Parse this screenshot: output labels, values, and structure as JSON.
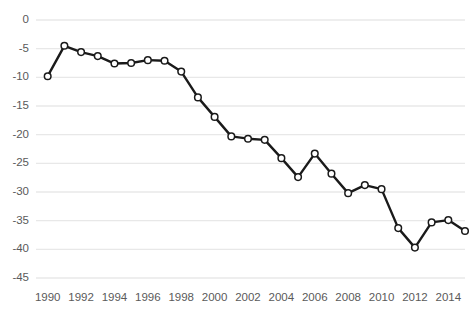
{
  "chart_data": {
    "type": "line",
    "title": "",
    "subtitle": "",
    "xlabel": "",
    "ylabel": "",
    "grid": true,
    "grid_axis": "y",
    "legend": false,
    "legend_position": "none",
    "xlim": [
      1989.3,
      2015.0
    ],
    "ylim": [
      -45,
      0
    ],
    "yticks": [
      0,
      -5,
      -10,
      -15,
      -20,
      -25,
      -30,
      -35,
      -40,
      -45
    ],
    "ytick_labels": [
      "0",
      "-5",
      "-10",
      "-15",
      "-20",
      "-25",
      "-30",
      "-35",
      "-40",
      "-45"
    ],
    "xticks": [
      1990,
      1992,
      1994,
      1996,
      1998,
      2000,
      2002,
      2004,
      2006,
      2008,
      2010,
      2012,
      2014
    ],
    "xtick_labels": [
      "1990",
      "1992",
      "1994",
      "1996",
      "1998",
      "2000",
      "2002",
      "2004",
      "2006",
      "2008",
      "2010",
      "2012",
      "2014"
    ],
    "x": [
      1990,
      1991,
      1992,
      1993,
      1994,
      1995,
      1996,
      1997,
      1998,
      1999,
      2000,
      2001,
      2002,
      2003,
      2004,
      2005,
      2006,
      2007,
      2008,
      2009,
      2010,
      2011,
      2012,
      2013,
      2014,
      2015
    ],
    "values": [
      -9.8,
      -4.5,
      -5.6,
      -6.3,
      -7.6,
      -7.5,
      -7.0,
      -7.1,
      -9.0,
      -13.5,
      -16.9,
      -20.3,
      -20.7,
      -20.9,
      -24.1,
      -27.4,
      -23.3,
      -26.8,
      -30.2,
      -28.8,
      -29.5,
      -36.3,
      -39.7,
      -35.3,
      -34.9,
      -36.8
    ],
    "series": [
      {
        "name": "series-1",
        "values": [
          -9.8,
          -4.5,
          -5.6,
          -6.3,
          -7.6,
          -7.5,
          -7.0,
          -7.1,
          -9.0,
          -13.5,
          -16.9,
          -20.3,
          -20.7,
          -20.9,
          -24.1,
          -27.4,
          -23.3,
          -26.8,
          -30.2,
          -28.8,
          -29.5,
          -36.3,
          -39.7,
          -35.3,
          -34.9,
          -36.8
        ],
        "line_color": "#1a1a1a",
        "marker": "circle-open",
        "marker_face_color": "#ffffff",
        "marker_edge_color": "#1a1a1a"
      }
    ],
    "colors": {
      "line": "#1a1a1a",
      "marker_fill": "#ffffff",
      "marker_edge": "#1a1a1a",
      "gridline": "#e8e8e8",
      "tick_text": "#5a5a5a",
      "background": "#ffffff"
    }
  }
}
